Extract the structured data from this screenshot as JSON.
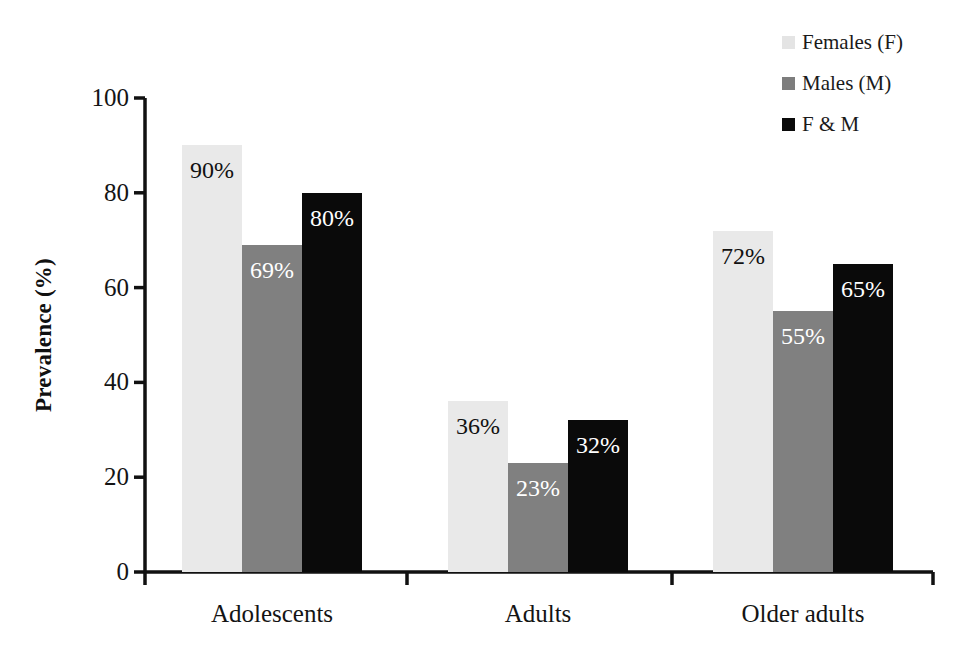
{
  "chart_data": {
    "type": "bar",
    "title": "",
    "xlabel": "",
    "ylabel": "Prevalence (%)",
    "ylim": [
      0,
      100
    ],
    "ytick_labels": [
      "100",
      "80",
      "60",
      "40",
      "20",
      "0"
    ],
    "ytick_values": [
      100,
      80,
      60,
      40,
      20,
      0
    ],
    "grid": false,
    "legend_position": "top-right",
    "categories": [
      "Adolescents",
      "Adults",
      "Older adults"
    ],
    "series": [
      {
        "name": "Females (F)",
        "color": "#e9e9e9",
        "label_color": "#111111",
        "values": [
          90,
          36,
          72
        ],
        "data_labels": [
          "90%",
          "36%",
          "72%"
        ]
      },
      {
        "name": "Males (M)",
        "color": "#808080",
        "label_color": "#ffffff",
        "values": [
          69,
          23,
          55
        ],
        "data_labels": [
          "69%",
          "23%",
          "55%"
        ]
      },
      {
        "name": "F & M",
        "color": "#0a0a0a",
        "label_color": "#ffffff",
        "values": [
          80,
          32,
          65
        ],
        "data_labels": [
          "80%",
          "32%",
          "65%"
        ]
      }
    ]
  },
  "legend": {
    "items": [
      {
        "label": "Females (F)",
        "swatch": "#e4e4e4"
      },
      {
        "label": "Males (M)",
        "swatch": "#7d7d7d"
      },
      {
        "label": "F & M",
        "swatch": "#0a0a0a"
      }
    ]
  },
  "axis": {
    "y_title": "Prevalence (%)",
    "axis_color": "#111111"
  }
}
